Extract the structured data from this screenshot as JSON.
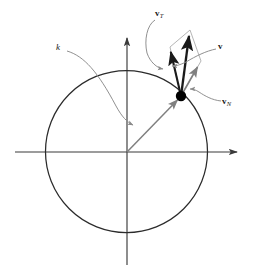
{
  "figure": {
    "background_color": "#ffffff",
    "width": 258,
    "height": 278
  },
  "colors": {
    "axis": "#3a3a3a",
    "circle": "#2b2b2b",
    "vector_primary": "#1a1a1a",
    "vector_secondary": "#808080",
    "leader": "#8a8a8a",
    "parallelogram": "#a0a0a0",
    "point": "#000000",
    "label": "#1a1a1a"
  },
  "labels": {
    "k": {
      "text": "k",
      "style": "italic"
    },
    "v_tangential": {
      "base": "v",
      "sub": "T"
    },
    "v_total": {
      "base": "v",
      "sub": ""
    },
    "v_normal": {
      "base": "v",
      "sub": "N"
    }
  },
  "geometry": {
    "origin": {
      "x": 127,
      "y": 152
    },
    "circle": {
      "cx": 126.5,
      "cy": 151.5,
      "r": 81
    },
    "x_axis": {
      "x1": 15,
      "y1": 152,
      "x2": 243,
      "y2": 152
    },
    "y_axis": {
      "x1": 127,
      "y1": 32,
      "x2": 127,
      "y2": 265
    },
    "point_on_circle": {
      "x": 181,
      "y": 96,
      "radius": 5
    },
    "radius_vector": {
      "from": {
        "x": 127,
        "y": 152
      },
      "to": {
        "x": 181,
        "y": 96
      }
    },
    "v_tangential_vector": {
      "from": {
        "x": 181,
        "y": 96
      },
      "to": {
        "x": 170,
        "y": 47
      }
    },
    "v_normal_vector": {
      "from": {
        "x": 181,
        "y": 96
      },
      "to": {
        "x": 201,
        "y": 61
      }
    },
    "v_total_vector": {
      "from": {
        "x": 181,
        "y": 96
      },
      "to": {
        "x": 190,
        "y": 30
      }
    },
    "parallelogram": [
      {
        "x": 181,
        "y": 96
      },
      {
        "x": 170,
        "y": 47
      },
      {
        "x": 190,
        "y": 30
      },
      {
        "x": 201,
        "y": 61
      }
    ]
  }
}
